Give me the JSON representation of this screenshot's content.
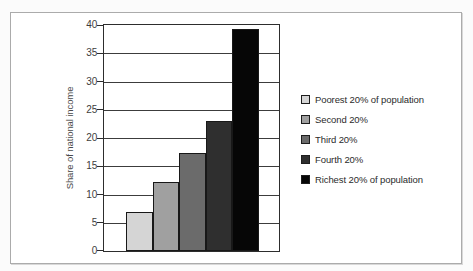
{
  "frame": {
    "background": "#ffffff",
    "border_color": "#ababab"
  },
  "chart_data": {
    "type": "bar",
    "title": "",
    "xlabel": "",
    "ylabel": "Share of national income",
    "ylim": [
      0,
      40
    ],
    "yticks": [
      0,
      5,
      10,
      15,
      20,
      25,
      30,
      35,
      40
    ],
    "grid": true,
    "legend_position": "right",
    "categories": [
      "Poorest 20% of population",
      "Second 20%",
      "Third 20%",
      "Fourth 20%",
      "Richest 20% of population"
    ],
    "values": [
      7,
      12.3,
      17.3,
      23,
      39.3
    ],
    "bar_colors": [
      "#d5d5d5",
      "#a0a0a0",
      "#6b6b6b",
      "#2f2f2f",
      "#060606"
    ],
    "bar_border_color": "#181818",
    "axis_color": "#2d2d2d",
    "grid_color": "#3c3c3c",
    "tick_label_color": "#3d3d3d",
    "ylabel_color": "#4a4a4a",
    "legend_text_color": "#2b2b2b"
  }
}
